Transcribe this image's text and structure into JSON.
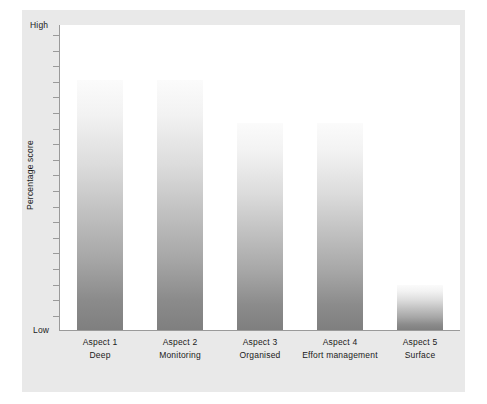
{
  "chart_data": {
    "type": "bar",
    "title": "",
    "subtitle": "",
    "xlabel": "",
    "ylabel": "Percentage score",
    "ylim": [
      0,
      100
    ],
    "ytick_labels": [
      "Low",
      "High"
    ],
    "grid": false,
    "legend": null,
    "axis_top_label": "High",
    "axis_bottom_label": "Low",
    "categories": [
      "Aspect 1",
      "Aspect 2",
      "Aspect 3",
      "Aspect 4",
      "Aspect 5"
    ],
    "category_sublabels": [
      "Deep",
      "Monitoring",
      "Organised",
      "Effort management",
      "Surface"
    ],
    "values": [
      82,
      82,
      68,
      68,
      15
    ],
    "bar_tops_px": [
      80,
      80,
      123,
      123,
      285
    ],
    "colors": {
      "bar_gradient_top": "#fbfbfb",
      "bar_gradient_bottom": "#7f7f7f",
      "panel_background": "#e9e9e9",
      "plot_background": "#ffffff",
      "axis_line": "#9a9a9a",
      "text": "#1a1a1a"
    }
  }
}
